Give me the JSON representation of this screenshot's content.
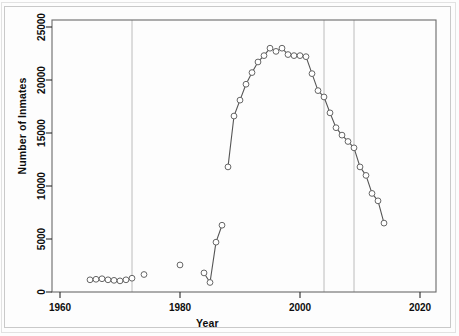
{
  "chart_data": {
    "type": "scatter",
    "title": "",
    "xlabel": "Year",
    "ylabel": "Number of Inmates",
    "xlim": [
      1960,
      2020
    ],
    "ylim": [
      0,
      25800
    ],
    "xticks": [
      1960,
      1980,
      2000,
      2020
    ],
    "yticks": [
      0,
      5000,
      10000,
      15000,
      20000,
      25000
    ],
    "grid": false,
    "legend": null,
    "marker": "open-circle",
    "line_color": "#555555",
    "marker_edge_color": "#666666",
    "vline_color": "#b4b4b4",
    "vlines": [
      1972,
      2004,
      2009
    ],
    "series": [
      {
        "name": "early-isolated-points",
        "connected": false,
        "points": [
          {
            "x": 1965,
            "y": 1150
          },
          {
            "x": 1966,
            "y": 1200
          },
          {
            "x": 1967,
            "y": 1250
          },
          {
            "x": 1968,
            "y": 1150
          },
          {
            "x": 1969,
            "y": 1100
          },
          {
            "x": 1970,
            "y": 1050
          },
          {
            "x": 1971,
            "y": 1150
          },
          {
            "x": 1972,
            "y": 1300
          },
          {
            "x": 1974,
            "y": 1650
          },
          {
            "x": 1980,
            "y": 2550
          }
        ]
      },
      {
        "name": "mid-1980s-rise",
        "connected": true,
        "points": [
          {
            "x": 1984,
            "y": 1800
          },
          {
            "x": 1985,
            "y": 900
          },
          {
            "x": 1986,
            "y": 4700
          },
          {
            "x": 1987,
            "y": 6300
          }
        ]
      },
      {
        "name": "main-series",
        "connected": true,
        "points": [
          {
            "x": 1988,
            "y": 11800
          },
          {
            "x": 1989,
            "y": 16600
          },
          {
            "x": 1990,
            "y": 18100
          },
          {
            "x": 1991,
            "y": 19600
          },
          {
            "x": 1992,
            "y": 20700
          },
          {
            "x": 1993,
            "y": 21700
          },
          {
            "x": 1994,
            "y": 22300
          },
          {
            "x": 1995,
            "y": 23000
          },
          {
            "x": 1996,
            "y": 22700
          },
          {
            "x": 1997,
            "y": 23000
          },
          {
            "x": 1998,
            "y": 22400
          },
          {
            "x": 1999,
            "y": 22300
          },
          {
            "x": 2000,
            "y": 22300
          },
          {
            "x": 2001,
            "y": 22200
          },
          {
            "x": 2002,
            "y": 20600
          },
          {
            "x": 2003,
            "y": 19000
          },
          {
            "x": 2004,
            "y": 18400
          },
          {
            "x": 2005,
            "y": 16900
          },
          {
            "x": 2006,
            "y": 15500
          },
          {
            "x": 2007,
            "y": 14800
          },
          {
            "x": 2008,
            "y": 14200
          },
          {
            "x": 2009,
            "y": 13600
          },
          {
            "x": 2010,
            "y": 11800
          },
          {
            "x": 2011,
            "y": 11000
          },
          {
            "x": 2012,
            "y": 9300
          },
          {
            "x": 2013,
            "y": 8600
          },
          {
            "x": 2014,
            "y": 6500
          }
        ]
      }
    ]
  },
  "axes": {
    "x_title": "Year",
    "y_title": "Number of Inmates",
    "x_tick_labels": [
      "1960",
      "1980",
      "2000",
      "2020"
    ],
    "y_tick_labels": [
      "0",
      "5000",
      "10000",
      "15000",
      "20000",
      "25000"
    ]
  }
}
